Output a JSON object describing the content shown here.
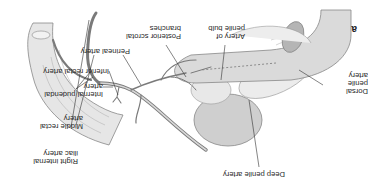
{
  "figure": {
    "panel_label": "a",
    "orientation": "rotated 180 degrees",
    "labels": {
      "artery_of_penile_bulb": "Artery of\npenile bulb",
      "posterior_scrotal_branches": "Posterior scrotal\nbranches",
      "perineal_artery": "Perineal artery",
      "inferior_rectal_artery": "Inferior rectal artery",
      "internal_pudendal_artery": "Internal pudendal\nartery",
      "middle_rectal_artery": "Middle rectal\nartery",
      "right_internal_iliac_artery": "Right internal\niliac artery",
      "dorsal_penile_artery": "Dorsal\npenile\nartery",
      "deep_penile_artery": "Deep penile artery"
    },
    "colors": {
      "line": "#333333",
      "tissue_light": "#eeeeee",
      "tissue_mid": "#d4d4d4",
      "tissue_dark": "#b5b5b5",
      "vessel": "#8a8a8a"
    }
  }
}
